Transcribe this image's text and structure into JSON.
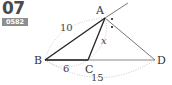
{
  "problem": {
    "number": "07",
    "code": "0582"
  },
  "figure": {
    "points": {
      "A": {
        "label": "A",
        "x": 105,
        "y": 18
      },
      "B": {
        "label": "B",
        "x": 45,
        "y": 60
      },
      "C": {
        "label": "C",
        "x": 88,
        "y": 60
      },
      "D": {
        "label": "D",
        "x": 155,
        "y": 60
      }
    },
    "measures": {
      "AB": "10",
      "BC": "6",
      "BD": "15",
      "AC": "x"
    }
  }
}
